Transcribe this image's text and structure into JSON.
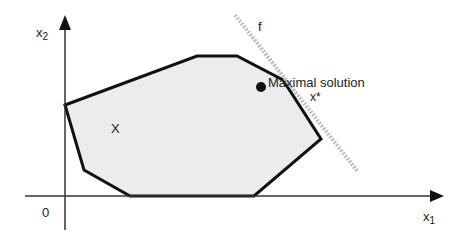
{
  "diagram": {
    "axes": {
      "x_label": "x",
      "x_subscript": "1",
      "y_label": "x",
      "y_subscript": "2",
      "origin_label": "0"
    },
    "region": {
      "label": "X",
      "fill_color": "#ececec",
      "stroke_color": "#111111",
      "vertices": [
        [
          65,
          105
        ],
        [
          84,
          170
        ],
        [
          130,
          196
        ],
        [
          254,
          196
        ],
        [
          321,
          139
        ],
        [
          283,
          80
        ],
        [
          237,
          56
        ],
        [
          197,
          56
        ]
      ]
    },
    "objective": {
      "label": "f",
      "line_color": "#b8b8b8",
      "from": [
        235,
        15
      ],
      "to": [
        358,
        172
      ]
    },
    "optimum": {
      "point_label": "x*",
      "annotation": "Maximal solution",
      "position": [
        261,
        87
      ]
    }
  }
}
